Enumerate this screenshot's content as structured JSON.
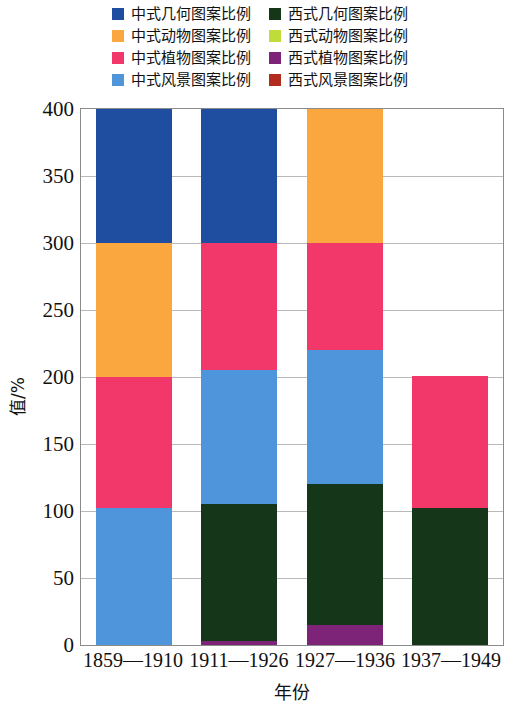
{
  "chart_data": {
    "type": "bar",
    "subtype": "stacked-vertical",
    "title": "",
    "xlabel": "年份",
    "ylabel": "值/%",
    "ylim": [
      0,
      400
    ],
    "yticks": [
      0,
      50,
      100,
      150,
      200,
      250,
      300,
      350,
      400
    ],
    "ytick_labels": [
      "0",
      "50",
      "100",
      "150",
      "200",
      "250",
      "300",
      "350",
      "400"
    ],
    "grid": true,
    "legend_position": "top",
    "categories": [
      "1859—1910",
      "1911—1926",
      "1927—1936",
      "1937—1949"
    ],
    "series": [
      {
        "name": "中式几何图案比例",
        "color": "#1F4EA1",
        "values": [
          100,
          100,
          0,
          0
        ]
      },
      {
        "name": "中式动物图案比例",
        "color": "#F9A73E",
        "values": [
          100,
          0,
          100,
          0
        ]
      },
      {
        "name": "中式植物图案比例",
        "color": "#F2386A",
        "values": [
          98,
          95,
          80,
          99
        ]
      },
      {
        "name": "中式风景图案比例",
        "color": "#4E95DB",
        "values": [
          102,
          100,
          100,
          0
        ]
      },
      {
        "name": "西式几何图案比例",
        "color": "#16361A",
        "values": [
          0,
          102,
          105,
          102
        ]
      },
      {
        "name": "西式动物图案比例",
        "color": "#BEDD3B",
        "values": [
          0,
          0,
          0,
          0
        ]
      },
      {
        "name": "西式植物图案比例",
        "color": "#7E2478",
        "values": [
          0,
          3,
          15,
          0
        ]
      },
      {
        "name": "西式风景图案比例",
        "color": "#B32B1E",
        "values": [
          0,
          0,
          0,
          0
        ]
      }
    ],
    "bar_totals": [
      400,
      400,
      400,
      201
    ],
    "stack_order_bottom_to_top": [
      "西式植物图案比例",
      "西式几何图案比例",
      "中式风景图案比例",
      "中式植物图案比例",
      "中式动物图案比例",
      "中式几何图案比例"
    ]
  },
  "legend": {
    "columns": [
      [
        {
          "label": "中式几何图案比例",
          "color": "#1F4EA1",
          "swatch": "legend-swatch-cn-geometric"
        },
        {
          "label": "中式动物图案比例",
          "color": "#F9A73E",
          "swatch": "legend-swatch-cn-animal"
        },
        {
          "label": "中式植物图案比例",
          "color": "#F2386A",
          "swatch": "legend-swatch-cn-plant"
        },
        {
          "label": "中式风景图案比例",
          "color": "#4E95DB",
          "swatch": "legend-swatch-cn-landscape"
        }
      ],
      [
        {
          "label": "西式几何图案比例",
          "color": "#16361A",
          "swatch": "legend-swatch-west-geometric"
        },
        {
          "label": "西式动物图案比例",
          "color": "#BEDD3B",
          "swatch": "legend-swatch-west-animal"
        },
        {
          "label": "西式植物图案比例",
          "color": "#7E2478",
          "swatch": "legend-swatch-west-plant"
        },
        {
          "label": "西式风景图案比例",
          "color": "#B32B1E",
          "swatch": "legend-swatch-west-landscape"
        }
      ]
    ]
  },
  "axes": {
    "y_title": "值/%",
    "x_title": "年份"
  }
}
